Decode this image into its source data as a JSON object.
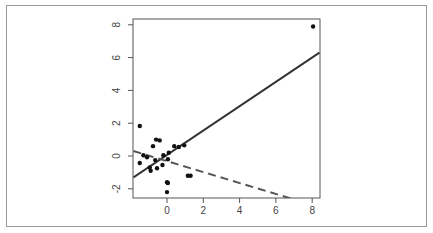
{
  "chart_data": {
    "type": "scatter",
    "title": "",
    "xlabel": "",
    "ylabel": "",
    "xlim": [
      -1.85,
      8.4
    ],
    "ylim": [
      -2.6,
      8.2
    ],
    "grid": false,
    "legend": null,
    "x_ticks": [
      0,
      2,
      4,
      6,
      8
    ],
    "y_ticks": [
      -2,
      0,
      2,
      4,
      6,
      8
    ],
    "series": [
      {
        "name": "points",
        "type": "scatter",
        "color": "#111111",
        "points": [
          {
            "x": -1.5,
            "y": 1.83
          },
          {
            "x": -1.5,
            "y": -0.43
          },
          {
            "x": -1.3,
            "y": 0.05
          },
          {
            "x": -1.1,
            "y": -0.08
          },
          {
            "x": -0.77,
            "y": 0.6
          },
          {
            "x": -0.6,
            "y": 1.0
          },
          {
            "x": -0.4,
            "y": 0.95
          },
          {
            "x": -0.9,
            "y": -0.9
          },
          {
            "x": -0.95,
            "y": -0.7
          },
          {
            "x": -0.65,
            "y": -0.25
          },
          {
            "x": -0.55,
            "y": -0.75
          },
          {
            "x": -0.2,
            "y": 0.05
          },
          {
            "x": -0.25,
            "y": -0.55
          },
          {
            "x": 0.05,
            "y": -0.2
          },
          {
            "x": 0.1,
            "y": 0.2
          },
          {
            "x": 0.4,
            "y": 0.6
          },
          {
            "x": 0.65,
            "y": 0.55
          },
          {
            "x": 0.95,
            "y": 0.65
          },
          {
            "x": 0.0,
            "y": -1.6
          },
          {
            "x": 0.05,
            "y": -1.65
          },
          {
            "x": 0.0,
            "y": -2.2
          },
          {
            "x": 1.15,
            "y": -1.2
          },
          {
            "x": 1.3,
            "y": -1.2
          },
          {
            "x": 8.05,
            "y": 7.9
          }
        ]
      },
      {
        "name": "fit-solid",
        "type": "line",
        "style": "solid",
        "color": "#333333",
        "x": [
          -1.85,
          8.4
        ],
        "y": [
          -1.3,
          6.3
        ]
      },
      {
        "name": "fit-dashed",
        "type": "line",
        "style": "dashed",
        "color": "#555555",
        "x": [
          -1.85,
          7.0
        ],
        "y": [
          0.3,
          -2.65
        ]
      }
    ]
  }
}
